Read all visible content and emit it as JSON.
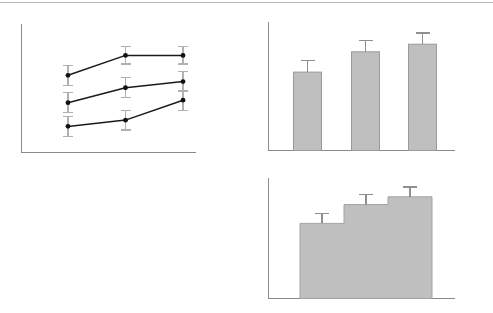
{
  "figure": {
    "title": "",
    "background_color": "#ffffff",
    "width": 493,
    "height": 313,
    "top_rule_color": "#b9b9b9",
    "axis_color": "#8a8a8a",
    "marker_color": "#111111",
    "line_color": "#1a1a1a",
    "error_bar_color": "#b0b0b0",
    "bar_fill_color": "#bfbfbf",
    "bar_stroke_color": "#9a9a9a"
  },
  "panels": [
    {
      "id": "panel-line",
      "label": "",
      "position": "top-left"
    },
    {
      "id": "panel-bars",
      "label": "",
      "position": "top-right"
    },
    {
      "id": "panel-hist",
      "label": "",
      "position": "bottom-right"
    }
  ],
  "chart_data": [
    {
      "type": "line",
      "panel": "top-left",
      "title": "",
      "xlabel": "",
      "ylabel": "",
      "grid": false,
      "legend": "none",
      "axis_tick_labels": [],
      "categories": [
        "1",
        "2",
        "3"
      ],
      "x": [
        1,
        2,
        3
      ],
      "xlim": [
        0.55,
        3.45
      ],
      "ylim": [
        0,
        100
      ],
      "series": [
        {
          "name": "Series 1",
          "values": [
            62,
            78,
            78
          ],
          "errors": [
            8,
            7,
            7
          ],
          "color": "#1a1a1a",
          "marker": "circle"
        },
        {
          "name": "Series 2",
          "values": [
            40,
            52,
            57
          ],
          "errors": [
            8,
            8,
            8
          ],
          "color": "#1a1a1a",
          "marker": "circle"
        },
        {
          "name": "Series 3",
          "values": [
            21,
            26,
            42
          ],
          "errors": [
            8,
            8,
            8
          ],
          "color": "#1a1a1a",
          "marker": "circle"
        }
      ]
    },
    {
      "type": "bar",
      "panel": "top-right",
      "title": "",
      "xlabel": "",
      "ylabel": "",
      "grid": false,
      "legend": "none",
      "axis_tick_labels": [],
      "categories": [
        "1",
        "2",
        "3"
      ],
      "values": [
        62,
        78,
        84
      ],
      "errors": [
        9,
        9,
        9
      ],
      "ylim": [
        0,
        100
      ],
      "bar_color": "#bfbfbf"
    },
    {
      "type": "bar",
      "panel": "bottom-right",
      "subtype": "step-histogram",
      "title": "",
      "xlabel": "",
      "ylabel": "",
      "grid": false,
      "legend": "none",
      "axis_tick_labels": [],
      "categories": [
        "1",
        "2",
        "3"
      ],
      "values": [
        68,
        85,
        92
      ],
      "errors": [
        9,
        9,
        9
      ],
      "ylim": [
        0,
        100
      ],
      "contiguous": true,
      "bar_color": "#bfbfbf"
    }
  ]
}
